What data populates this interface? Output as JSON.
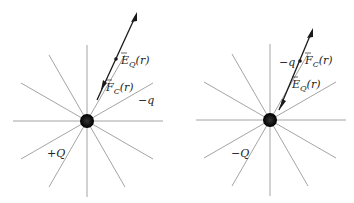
{
  "figure": {
    "panels": [
      {
        "id": "left",
        "source_charge": {
          "label": "+Q",
          "cx": 87,
          "cy": 121,
          "r": 7
        },
        "test_charge": {
          "label": "−q",
          "x": 116,
          "y": 59
        },
        "field_line_radius": 76,
        "field_line_count": 12,
        "vectors": [
          {
            "name": "E_Q",
            "label_main": "E",
            "label_sub": "Q",
            "label_arg": "(r⃗)",
            "direction": "away from source"
          },
          {
            "name": "F_C",
            "label_main": "F",
            "label_sub": "C",
            "label_arg": "(r⃗)",
            "direction": "toward source"
          }
        ]
      },
      {
        "id": "right",
        "source_charge": {
          "label": "−Q",
          "cx": 270,
          "cy": 120,
          "r": 7
        },
        "test_charge": {
          "label": "−q",
          "x": 300,
          "y": 61
        },
        "field_line_radius": 76,
        "field_line_count": 12,
        "vectors": [
          {
            "name": "F_C",
            "label_main": "F",
            "label_sub": "C",
            "label_arg": "(r⃗)",
            "direction": "away from source"
          },
          {
            "name": "E_Q",
            "label_main": "E",
            "label_sub": "Q",
            "label_arg": "(r⃗)",
            "direction": "toward source"
          }
        ]
      }
    ],
    "colors": {
      "field_lines": "#9a9a9a",
      "charge": "#111111",
      "vectors": "#1a1a1a"
    }
  }
}
